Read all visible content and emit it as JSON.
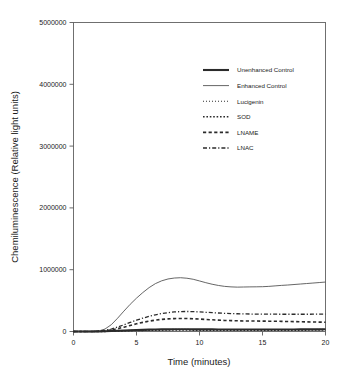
{
  "chart_data": {
    "type": "line",
    "title": "",
    "xlabel": "Time (minutes)",
    "ylabel": "Chemiluminescence (Relative light units)",
    "xlim": [
      0,
      20
    ],
    "ylim": [
      0,
      5000000
    ],
    "xticks": [
      0,
      5,
      10,
      15,
      20
    ],
    "xtick_labels": [
      "0",
      "5",
      "10",
      "15",
      "20"
    ],
    "yticks": [
      0,
      1000000,
      2000000,
      3000000,
      4000000,
      5000000
    ],
    "ytick_labels": [
      "0",
      "1000000",
      "2000000",
      "3000000",
      "4000000",
      "5000000"
    ],
    "grid": false,
    "legend_position": "upper-right-inside",
    "x": [
      0,
      0.5,
      1,
      1.5,
      2,
      2.5,
      3,
      3.5,
      4,
      4.5,
      5,
      5.5,
      6,
      6.5,
      7,
      7.5,
      8,
      8.5,
      9,
      9.5,
      10,
      10.5,
      11,
      11.5,
      12,
      12.5,
      13,
      13.5,
      14,
      14.5,
      15,
      15.5,
      16,
      16.5,
      17,
      17.5,
      18,
      18.5,
      19,
      19.5,
      20
    ],
    "series": [
      {
        "name": "Unenhanced Control",
        "style": "solid-thick",
        "color": "#2b2b2b",
        "width": 2.1,
        "dash": "none",
        "values": [
          0,
          0,
          0,
          0,
          2000,
          4000,
          8000,
          12000,
          16000,
          20000,
          24000,
          27000,
          30000,
          32000,
          34000,
          35000,
          36000,
          36000,
          36000,
          35000,
          35000,
          34000,
          34000,
          33000,
          33000,
          33000,
          32000,
          32000,
          32000,
          32000,
          32000,
          32000,
          32000,
          33000,
          33000,
          33000,
          34000,
          34000,
          35000,
          35000,
          36000
        ]
      },
      {
        "name": "Enhanced Control",
        "style": "solid-thin",
        "color": "#555555",
        "width": 0.9,
        "dash": "none",
        "values": [
          0,
          0,
          0,
          2000,
          8000,
          40000,
          110000,
          215000,
          330000,
          440000,
          540000,
          630000,
          710000,
          775000,
          820000,
          850000,
          865000,
          870000,
          862000,
          845000,
          818000,
          790000,
          765000,
          745000,
          730000,
          722000,
          718000,
          720000,
          722000,
          723000,
          725000,
          730000,
          738000,
          746000,
          752000,
          760000,
          768000,
          776000,
          784000,
          792000,
          800000
        ]
      },
      {
        "name": "Lucigenin",
        "style": "dotted-fine",
        "color": "#303030",
        "width": 1.1,
        "dash": "1,2",
        "values": [
          0,
          0,
          0,
          0,
          1000,
          3000,
          6000,
          10000,
          14000,
          18000,
          22000,
          25000,
          28000,
          30000,
          32000,
          33000,
          34000,
          34000,
          34000,
          33000,
          33000,
          32000,
          32000,
          31000,
          31000,
          31000,
          30000,
          30000,
          30000,
          30000,
          30000,
          30000,
          31000,
          31000,
          31000,
          32000,
          32000,
          33000,
          33000,
          34000,
          34000
        ]
      },
      {
        "name": "SOD",
        "style": "dotted-medium",
        "color": "#2b2b2b",
        "width": 1.6,
        "dash": "1.6,1.8",
        "values": [
          0,
          0,
          0,
          0,
          1000,
          2000,
          5000,
          8000,
          11000,
          14000,
          17000,
          19000,
          21000,
          22000,
          23000,
          24000,
          24000,
          24000,
          24000,
          23000,
          23000,
          22000,
          22000,
          22000,
          21000,
          21000,
          21000,
          21000,
          21000,
          21000,
          21000,
          21000,
          21000,
          22000,
          22000,
          22000,
          23000,
          23000,
          24000,
          24000,
          25000
        ]
      },
      {
        "name": "LNAME",
        "style": "dashed",
        "color": "#2b2b2b",
        "width": 1.6,
        "dash": "3.2,2.4",
        "values": [
          0,
          0,
          0,
          0,
          4000,
          12000,
          25000,
          45000,
          70000,
          98000,
          124000,
          148000,
          168000,
          184000,
          196000,
          204000,
          209000,
          211000,
          210000,
          206000,
          201000,
          195000,
          189000,
          184000,
          179000,
          176000,
          173000,
          171000,
          170000,
          169000,
          168000,
          167000,
          166000,
          164000,
          162000,
          160000,
          158000,
          156000,
          154000,
          152000,
          150000
        ]
      },
      {
        "name": "LNAC",
        "style": "dash-dot",
        "color": "#2b2b2b",
        "width": 1.3,
        "dash": "4,2,1.2,2",
        "values": [
          0,
          0,
          0,
          0,
          6000,
          18000,
          40000,
          72000,
          108000,
          146000,
          183000,
          216000,
          245000,
          270000,
          290000,
          305000,
          316000,
          322000,
          324000,
          322000,
          317000,
          311000,
          305000,
          299000,
          294000,
          290000,
          287000,
          285000,
          283000,
          282000,
          281000,
          280000,
          280000,
          279000,
          279000,
          279000,
          279000,
          279000,
          280000,
          280000,
          281000
        ]
      }
    ]
  },
  "legend": {
    "entries": [
      {
        "label": "Unenhanced Control"
      },
      {
        "label": "Enhanced Control"
      },
      {
        "label": "Lucigenin"
      },
      {
        "label": "SOD"
      },
      {
        "label": "LNAME"
      },
      {
        "label": "LNAC"
      }
    ]
  }
}
